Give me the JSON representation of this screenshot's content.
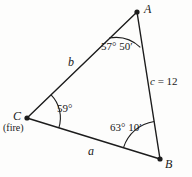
{
  "figure": {
    "type": "triangle-diagram",
    "stroke_color": "#1c1c1c",
    "background_color": "#fdfdfc",
    "vertices": [
      {
        "name": "A",
        "label": "A",
        "x": 137,
        "y": 12
      },
      {
        "name": "B",
        "label": "B",
        "x": 160,
        "y": 159
      },
      {
        "name": "C",
        "label": "C",
        "x": 27,
        "y": 118,
        "sublabel": "(fire)"
      }
    ],
    "sides": [
      {
        "name": "a",
        "label": "a",
        "from": "C",
        "to": "B"
      },
      {
        "name": "b",
        "label": "b",
        "from": "C",
        "to": "A"
      },
      {
        "name": "c",
        "label_var": "c",
        "label_value": "= 12",
        "from": "A",
        "to": "B"
      }
    ],
    "angles": [
      {
        "at": "A",
        "label": "57° 50′"
      },
      {
        "at": "B",
        "label": "63° 10′"
      },
      {
        "at": "C",
        "label": "59°"
      }
    ]
  }
}
